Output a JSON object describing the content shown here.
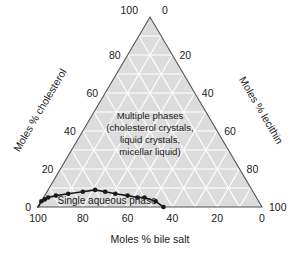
{
  "chart_data": {
    "type": "line",
    "chart_kind": "ternary-phase-diagram",
    "title": "",
    "axes": {
      "bottom": {
        "label": "Moles % bile salt",
        "ticks": [
          "100",
          "80",
          "60",
          "40",
          "20",
          "0"
        ],
        "tick_values": [
          100,
          80,
          60,
          40,
          20,
          0
        ],
        "direction": "left-to-right decreasing",
        "range": [
          0,
          100
        ]
      },
      "left": {
        "label": "Moles % cholesterol",
        "ticks": [
          "0",
          "20",
          "40",
          "60",
          "80",
          "100"
        ],
        "tick_values": [
          0,
          20,
          40,
          60,
          80,
          100
        ],
        "direction": "bottom-to-top increasing",
        "range": [
          0,
          100
        ]
      },
      "right": {
        "label": "Moles % lecithin",
        "ticks": [
          "0",
          "20",
          "40",
          "60",
          "80",
          "100"
        ],
        "tick_values": [
          0,
          20,
          40,
          60,
          80,
          100
        ],
        "direction": "top-to-bottom increasing",
        "range": [
          0,
          100
        ]
      }
    },
    "grid": true,
    "grid_interval": 10,
    "legend": "none",
    "annotations": [
      {
        "name": "multiple-phases",
        "lines": [
          "Multiple phases",
          "(cholesterol crystals,",
          "liquid crystals,",
          "micellar liquid)"
        ]
      },
      {
        "name": "single-aqueous-phase",
        "lines": [
          "Single aqueous phase"
        ]
      }
    ],
    "series": [
      {
        "name": "phase boundary",
        "marker": "filled-circle",
        "points_bile_salt": [
          100,
          97,
          95,
          93,
          89,
          83,
          76,
          70,
          66,
          62,
          57,
          53,
          50,
          46,
          44
        ],
        "points_cholesterol": [
          0,
          3,
          4,
          5,
          6,
          7,
          8,
          9,
          8,
          7,
          6,
          5,
          5,
          3,
          0
        ],
        "points_lecithin": [
          0,
          0,
          1,
          2,
          5,
          10,
          16,
          21,
          26,
          31,
          37,
          42,
          45,
          51,
          56
        ]
      }
    ]
  },
  "colors": {
    "triangle_fill": "#dcdcdc",
    "grid_line": "#ffffff",
    "triangle_edge": "#555555",
    "curve": "#1a1a1a",
    "text": "#1a1a1a",
    "background": "#ffffff"
  },
  "apex_labels": {
    "left": "100",
    "right": "0"
  }
}
